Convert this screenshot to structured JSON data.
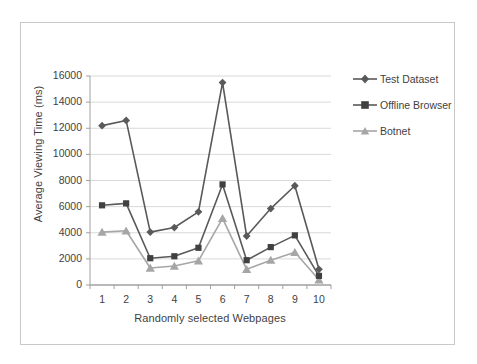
{
  "chart_data": {
    "type": "line",
    "title": "",
    "xlabel": "Randomly selected Webpages",
    "ylabel": "Average Viewing Time (ms)",
    "categories": [
      "1",
      "2",
      "3",
      "4",
      "5",
      "6",
      "7",
      "8",
      "9",
      "10"
    ],
    "ylim": [
      0,
      16000
    ],
    "ytick_labels": [
      "0",
      "2000",
      "4000",
      "6000",
      "8000",
      "10000",
      "12000",
      "14000",
      "16000"
    ],
    "ytick_values": [
      0,
      2000,
      4000,
      6000,
      8000,
      10000,
      12000,
      14000,
      16000
    ],
    "grid": "horizontal",
    "legend_position": "right",
    "series": [
      {
        "name": "Test Dataset",
        "marker": "diamond",
        "color": "#595959",
        "values": [
          12200,
          12600,
          4050,
          4400,
          5600,
          15500,
          3750,
          5850,
          7600,
          1200
        ]
      },
      {
        "name": "Offline Browser",
        "marker": "square",
        "color": "#595959",
        "values": [
          6100,
          6250,
          2050,
          2200,
          2850,
          7700,
          1900,
          2900,
          3800,
          700
        ]
      },
      {
        "name": "Botnet",
        "marker": "triangle",
        "color": "#a6a6a6",
        "values": [
          4050,
          4150,
          1300,
          1450,
          1850,
          5100,
          1200,
          1900,
          2500,
          400
        ]
      }
    ]
  },
  "colors": {
    "axis": "#a0a0a0",
    "grid": "#d9d9d9",
    "text": "#3f3f3f",
    "frame": "#c9c9c9",
    "series_dark": "#595959",
    "series_light": "#a6a6a6"
  },
  "legend": {
    "items": [
      {
        "label": "Test Dataset"
      },
      {
        "label": "Offline Browser"
      },
      {
        "label": "Botnet"
      }
    ]
  }
}
